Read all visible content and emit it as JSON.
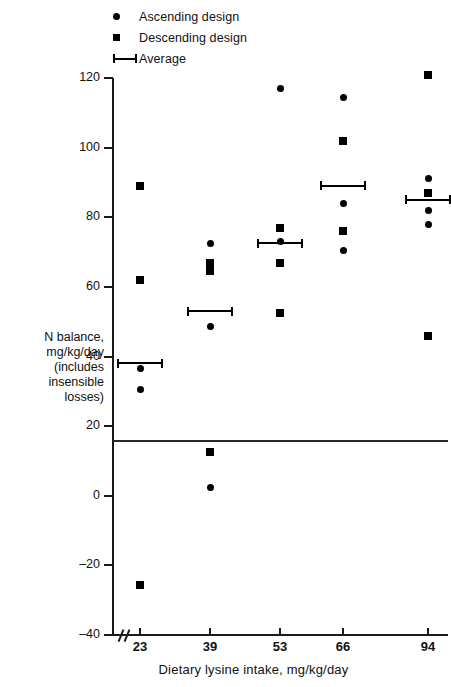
{
  "legend": {
    "items": [
      {
        "label": "Ascending design",
        "marker": "circle-marker"
      },
      {
        "label": "Descending design",
        "marker": "square-marker"
      },
      {
        "label": "Average",
        "marker": "average-bar-marker"
      }
    ]
  },
  "axes": {
    "y": {
      "label_lines": [
        "N balance,",
        "mg/kg/day",
        "(includes",
        "insensible",
        "losses)"
      ],
      "label": "N balance, mg/kg/day (includes insensible losses)",
      "ticks": [
        120,
        100,
        80,
        60,
        40,
        20,
        0,
        -20,
        -40
      ],
      "tick_labels": [
        "120",
        "100",
        "80",
        "60",
        "40",
        "20",
        "0",
        "–20",
        "–40"
      ],
      "min": -40,
      "max": 120
    },
    "x": {
      "label": "Dietary lysine intake, mg/kg/day",
      "tick_labels": [
        "23",
        "39",
        "53",
        "66",
        "94"
      ],
      "categories": [
        23,
        39,
        53,
        66,
        94
      ],
      "has_axis_break": true
    }
  },
  "reference_line": {
    "value": 16,
    "name": "zero-equilibrium-reference-line"
  },
  "chart_data": {
    "type": "scatter",
    "title": "",
    "xlabel": "Dietary lysine intake, mg/kg/day",
    "ylabel": "N balance, mg/kg/day (includes insensible losses)",
    "categories": [
      23,
      39,
      53,
      66,
      94
    ],
    "ylim": [
      -40,
      120
    ],
    "grid": false,
    "legend_position": "top-left",
    "reference_line_y": 16,
    "series": [
      {
        "name": "Ascending design",
        "marker": "circle",
        "points": [
          {
            "x": 23,
            "y": 36.5
          },
          {
            "x": 23,
            "y": 30.5
          },
          {
            "x": 39,
            "y": 72.5
          },
          {
            "x": 39,
            "y": 48.5
          },
          {
            "x": 39,
            "y": 2.5
          },
          {
            "x": 53,
            "y": 117
          },
          {
            "x": 53,
            "y": 73
          },
          {
            "x": 53,
            "y": 67
          },
          {
            "x": 53,
            "y": 52.5
          },
          {
            "x": 66,
            "y": 114.5
          },
          {
            "x": 66,
            "y": 84
          },
          {
            "x": 66,
            "y": 70.5
          },
          {
            "x": 94,
            "y": 91
          },
          {
            "x": 94,
            "y": 82
          },
          {
            "x": 94,
            "y": 78
          }
        ]
      },
      {
        "name": "Descending design",
        "marker": "square",
        "points": [
          {
            "x": 23,
            "y": 89
          },
          {
            "x": 23,
            "y": 62
          },
          {
            "x": 23,
            "y": -25.5
          },
          {
            "x": 39,
            "y": 67
          },
          {
            "x": 39,
            "y": 64.5
          },
          {
            "x": 39,
            "y": 12.5
          },
          {
            "x": 53,
            "y": 77
          },
          {
            "x": 53,
            "y": 67
          },
          {
            "x": 53,
            "y": 52.5
          },
          {
            "x": 66,
            "y": 102
          },
          {
            "x": 66,
            "y": 76
          },
          {
            "x": 94,
            "y": 121
          },
          {
            "x": 94,
            "y": 87
          },
          {
            "x": 94,
            "y": 46
          }
        ]
      },
      {
        "name": "Average",
        "marker": "average-bar",
        "points": [
          {
            "x": 23,
            "y": 38
          },
          {
            "x": 39,
            "y": 53
          },
          {
            "x": 53,
            "y": 72.5
          },
          {
            "x": 66,
            "y": 89
          },
          {
            "x": 94,
            "y": 85
          }
        ]
      }
    ]
  }
}
